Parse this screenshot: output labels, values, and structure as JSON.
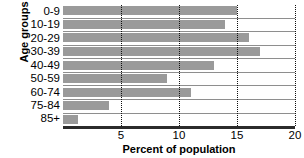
{
  "chart_data": {
    "type": "bar",
    "orientation": "horizontal",
    "title": "",
    "xlabel": "Percent of population",
    "ylabel": "Age groups",
    "categories": [
      "0-9",
      "10-19",
      "20-29",
      "30-39",
      "40-49",
      "50-59",
      "60-74",
      "75-84",
      "85+"
    ],
    "values": [
      15.0,
      14.0,
      16.0,
      17.0,
      13.0,
      9.0,
      11.0,
      4.0,
      1.3
    ],
    "series": [
      {
        "name": "Percent of population",
        "values": [
          15.0,
          14.0,
          16.0,
          17.0,
          13.0,
          9.0,
          11.0,
          4.0,
          1.3
        ]
      }
    ],
    "xlim": [
      0,
      20
    ],
    "xticks": [
      5,
      10,
      15,
      20
    ],
    "xticklabels": [
      "5",
      "10",
      "15",
      "20"
    ],
    "grid": "vertical-dotted",
    "legend": "none",
    "bar_color": "#9a9a9a",
    "gridline_color": "#111111",
    "axis_color": "#2b2b2b",
    "row_rule_color": "#8e8e8e"
  }
}
